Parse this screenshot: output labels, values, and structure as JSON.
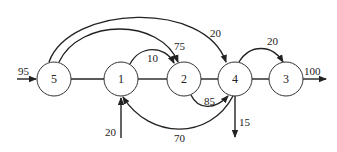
{
  "diagram": {
    "type": "network-flow",
    "nodes": [
      {
        "id": "5",
        "label": "5",
        "cx": 54,
        "cy": 79
      },
      {
        "id": "1",
        "label": "1",
        "cx": 121,
        "cy": 79
      },
      {
        "id": "2",
        "label": "2",
        "cx": 184,
        "cy": 79
      },
      {
        "id": "4",
        "label": "4",
        "cx": 235,
        "cy": 79
      },
      {
        "id": "3",
        "label": "3",
        "cx": 286,
        "cy": 79
      }
    ],
    "edges": [
      {
        "from": "source",
        "to": "5",
        "flow": "95"
      },
      {
        "from": "5",
        "to": "2",
        "flow": "75"
      },
      {
        "from": "5",
        "to": "4",
        "flow": "20"
      },
      {
        "from": "1",
        "to": "2",
        "flow": "10"
      },
      {
        "from": "2",
        "to": "4",
        "flow": "85"
      },
      {
        "from": "4",
        "to": "3",
        "flow": "20"
      },
      {
        "from": "4",
        "to": "1",
        "flow": "70"
      },
      {
        "from": "source",
        "to": "1",
        "flow": "20"
      },
      {
        "from": "4",
        "to": "sink",
        "flow": "15"
      },
      {
        "from": "3",
        "to": "sink",
        "flow": "100"
      }
    ],
    "undirected_links": [
      [
        "5",
        "1"
      ],
      [
        "1",
        "2"
      ],
      [
        "2",
        "4"
      ],
      [
        "4",
        "3"
      ]
    ]
  }
}
